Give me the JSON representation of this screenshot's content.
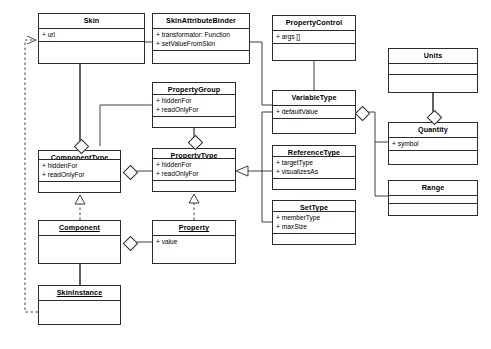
{
  "diagram": {
    "type": "uml-class-diagram",
    "background": "#ffffff",
    "line_color": "#2b2b2b",
    "classes": [
      {
        "id": "skin",
        "name": "Skin",
        "stereotype": "",
        "instance": false,
        "attributes": [
          "+ url"
        ],
        "operations": [],
        "x": 38,
        "y": 13,
        "w": 107,
        "h": 51
      },
      {
        "id": "skinattributebinder",
        "name": "SkinAttributeBinder",
        "stereotype": "",
        "instance": false,
        "attributes": [
          "+ transformator: Function",
          "+ setValueFromSkin"
        ],
        "operations": [],
        "x": 152,
        "y": 13,
        "w": 98,
        "h": 51
      },
      {
        "id": "propertycontrol",
        "name": "PropertyControl",
        "stereotype": "",
        "instance": false,
        "attributes": [
          "+ args []"
        ],
        "operations": [],
        "x": 272,
        "y": 15,
        "w": 84,
        "h": 46
      },
      {
        "id": "units",
        "name": "Units",
        "stereotype": "",
        "instance": false,
        "attributes": [],
        "operations": [],
        "x": 388,
        "y": 48,
        "w": 90,
        "h": 45
      },
      {
        "id": "propertygroup",
        "name": "PropertyGroup",
        "stereotype": "",
        "instance": false,
        "attributes": [
          "+ hiddenFor",
          "+ readOnlyFor"
        ],
        "operations": [],
        "x": 152,
        "y": 82,
        "w": 84,
        "h": 46
      },
      {
        "id": "variabletype",
        "name": "VariableType",
        "stereotype": "",
        "instance": false,
        "attributes": [
          "+ defaultValue"
        ],
        "operations": [],
        "x": 272,
        "y": 90,
        "w": 84,
        "h": 44
      },
      {
        "id": "quantity",
        "name": "Quantity",
        "stereotype": "",
        "instance": false,
        "attributes": [
          "+ symbol"
        ],
        "operations": [],
        "x": 388,
        "y": 122,
        "w": 90,
        "h": 43
      },
      {
        "id": "componenttype",
        "name": "ComponentType",
        "stereotype": "",
        "instance": false,
        "attributes": [
          "+ hiddenFor",
          "+ readOnlyFor"
        ],
        "operations": [],
        "x": 38,
        "y": 150,
        "w": 83,
        "h": 43
      },
      {
        "id": "propertytype",
        "name": "PropertyType",
        "stereotype": "",
        "instance": false,
        "attributes": [
          "+ hiddenFor",
          "+ readOnlyFor"
        ],
        "operations": [],
        "x": 152,
        "y": 148,
        "w": 84,
        "h": 44
      },
      {
        "id": "referencetype",
        "name": "ReferenceType",
        "stereotype": "",
        "instance": false,
        "attributes": [
          "+ targetType",
          "+ visualizesAs"
        ],
        "operations": [],
        "x": 272,
        "y": 145,
        "w": 84,
        "h": 45
      },
      {
        "id": "range",
        "name": "Range",
        "stereotype": "",
        "instance": false,
        "attributes": [],
        "operations": [],
        "x": 388,
        "y": 180,
        "w": 90,
        "h": 36
      },
      {
        "id": "settype",
        "name": "SetType",
        "stereotype": "",
        "instance": false,
        "attributes": [
          "+ memberType",
          "+ maxSize"
        ],
        "operations": [],
        "x": 272,
        "y": 200,
        "w": 84,
        "h": 45
      },
      {
        "id": "component",
        "name": "Component",
        "stereotype": "",
        "instance": true,
        "attributes": [],
        "operations": [],
        "x": 38,
        "y": 220,
        "w": 83,
        "h": 44
      },
      {
        "id": "property",
        "name": "Property",
        "stereotype": "",
        "instance": true,
        "attributes": [
          "+ value"
        ],
        "operations": [],
        "x": 152,
        "y": 220,
        "w": 84,
        "h": 44
      },
      {
        "id": "skininstance",
        "name": "SkinInstance",
        "stereotype": "",
        "instance": true,
        "attributes": [],
        "operations": [],
        "x": 38,
        "y": 285,
        "w": 83,
        "h": 40
      }
    ],
    "relationships": [
      {
        "kind": "association",
        "from": "skin",
        "to": "skinattributebinder",
        "label": ""
      },
      {
        "kind": "composition",
        "from": "skin",
        "to": "componenttype",
        "label": ""
      },
      {
        "kind": "association",
        "from": "skinattributebinder",
        "to": "variabletype",
        "label": ""
      },
      {
        "kind": "composition",
        "from": "propertygroup",
        "to": "propertytype",
        "label": ""
      },
      {
        "kind": "association",
        "from": "propertygroup",
        "to": "componenttype",
        "label": ""
      },
      {
        "kind": "aggregation",
        "from": "componenttype",
        "to": "propertytype",
        "label": ""
      },
      {
        "kind": "generalization",
        "from": "variabletype",
        "to": "propertytype",
        "label": ""
      },
      {
        "kind": "generalization",
        "from": "referencetype",
        "to": "propertytype",
        "label": ""
      },
      {
        "kind": "generalization",
        "from": "settype",
        "to": "propertytype",
        "label": ""
      },
      {
        "kind": "association",
        "from": "propertycontrol",
        "to": "variabletype",
        "label": ""
      },
      {
        "kind": "aggregation",
        "from": "variabletype",
        "to": "quantity",
        "label": ""
      },
      {
        "kind": "aggregation",
        "from": "variabletype",
        "to": "range",
        "label": ""
      },
      {
        "kind": "composition",
        "from": "units",
        "to": "quantity",
        "label": ""
      },
      {
        "kind": "realization",
        "from": "component",
        "to": "componenttype",
        "label": ""
      },
      {
        "kind": "realization",
        "from": "property",
        "to": "propertytype",
        "label": ""
      },
      {
        "kind": "aggregation",
        "from": "component",
        "to": "property",
        "label": ""
      },
      {
        "kind": "composition",
        "from": "component",
        "to": "skininstance",
        "label": ""
      },
      {
        "kind": "realization",
        "from": "skininstance",
        "to": "skin",
        "label": ""
      }
    ]
  }
}
